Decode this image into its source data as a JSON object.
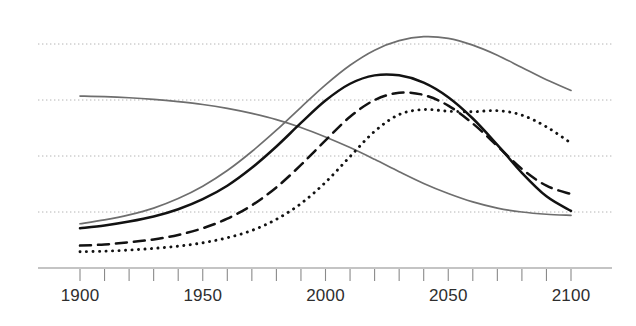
{
  "chart_data": {
    "type": "line",
    "title": "",
    "subtitle": "",
    "xlabel": "",
    "ylabel": "",
    "xlim": [
      1900,
      2100
    ],
    "ylim": [
      0,
      5
    ],
    "grid": true,
    "grid_axis": "y",
    "gridline_values": [
      1,
      2,
      3,
      4
    ],
    "legend": "none",
    "xticks": [
      1900,
      1910,
      1920,
      1930,
      1940,
      1950,
      1960,
      1970,
      1980,
      1990,
      2000,
      2010,
      2020,
      2030,
      2040,
      2050,
      2060,
      2070,
      2080,
      2090,
      2100
    ],
    "xtick_labels": [
      "1900",
      "",
      "",
      "",
      "",
      "1950",
      "",
      "",
      "",
      "",
      "2000",
      "",
      "",
      "",
      "",
      "2050",
      "",
      "",
      "",
      "",
      "2100"
    ],
    "x": [
      1900,
      1910,
      1920,
      1930,
      1940,
      1950,
      1960,
      1970,
      1980,
      1990,
      2000,
      2010,
      2020,
      2030,
      2040,
      2050,
      2060,
      2070,
      2080,
      2090,
      2100
    ],
    "series": [
      {
        "name": "declining-gray-curve",
        "style": "solid",
        "color": "#6e6e6e",
        "width": 1.7,
        "values": [
          3.07,
          3.06,
          3.04,
          3.01,
          2.97,
          2.92,
          2.85,
          2.76,
          2.65,
          2.51,
          2.34,
          2.15,
          1.94,
          1.72,
          1.51,
          1.33,
          1.18,
          1.07,
          1.0,
          0.96,
          0.94
        ]
      },
      {
        "name": "peaking-gray-curve",
        "style": "solid",
        "color": "#6e6e6e",
        "width": 1.7,
        "values": [
          0.79,
          0.86,
          0.95,
          1.07,
          1.24,
          1.46,
          1.74,
          2.08,
          2.46,
          2.87,
          3.27,
          3.62,
          3.89,
          4.06,
          4.13,
          4.1,
          3.98,
          3.8,
          3.58,
          3.36,
          3.17
        ]
      },
      {
        "name": "black-solid-curve",
        "style": "solid",
        "color": "#121212",
        "width": 2.5,
        "values": [
          0.71,
          0.76,
          0.83,
          0.92,
          1.05,
          1.23,
          1.47,
          1.79,
          2.17,
          2.59,
          2.99,
          3.29,
          3.44,
          3.44,
          3.31,
          3.05,
          2.67,
          2.2,
          1.7,
          1.28,
          1.02
        ]
      },
      {
        "name": "black-dashed-curve",
        "style": "dashed",
        "color": "#121212",
        "width": 2.5,
        "values": [
          0.4,
          0.42,
          0.46,
          0.51,
          0.59,
          0.71,
          0.88,
          1.12,
          1.44,
          1.84,
          2.28,
          2.7,
          3.0,
          3.13,
          3.09,
          2.9,
          2.58,
          2.18,
          1.77,
          1.47,
          1.32
        ]
      },
      {
        "name": "black-dotted-curve",
        "style": "dotted",
        "color": "#121212",
        "width": 2.9,
        "values": [
          0.29,
          0.3,
          0.32,
          0.35,
          0.39,
          0.45,
          0.54,
          0.67,
          0.87,
          1.15,
          1.53,
          1.99,
          2.44,
          2.74,
          2.83,
          2.8,
          2.79,
          2.81,
          2.73,
          2.52,
          2.23
        ]
      }
    ]
  },
  "axis": {
    "tick_labels": [
      {
        "value": 1900,
        "label": "1900"
      },
      {
        "value": 1950,
        "label": "1950"
      },
      {
        "value": 2000,
        "label": "2000"
      },
      {
        "value": 2050,
        "label": "2050"
      },
      {
        "value": 2100,
        "label": "2100"
      }
    ]
  },
  "colors": {
    "background": "#ffffff",
    "gridline": "#b4b4b4",
    "axis": "#8a8a8a",
    "gray_series": "#6e6e6e",
    "black_series": "#121212",
    "tick_text": "#2e2e2e"
  }
}
